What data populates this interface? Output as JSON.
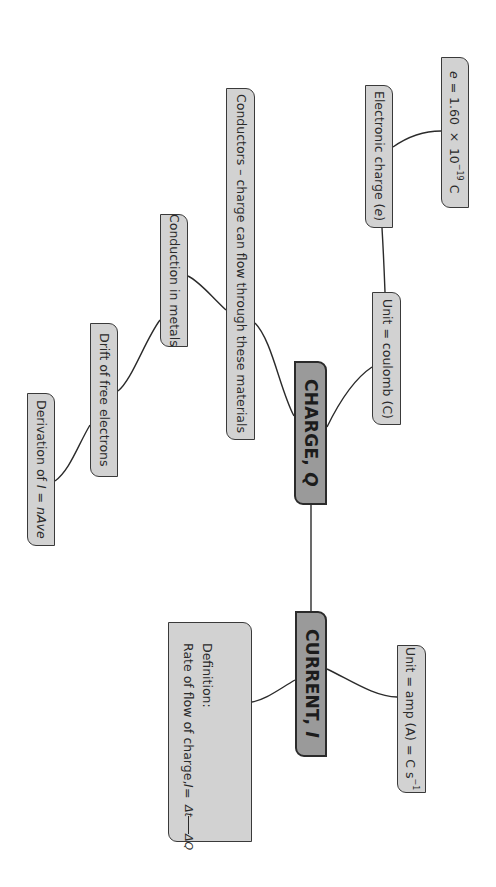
{
  "diagram": {
    "orientation": "rotated-90-clockwise",
    "colors": {
      "node_fill": "#d2d2d2",
      "main_node_fill": "#9a9a9a",
      "border": "#3a3a3a",
      "line": "#2b2b2b",
      "background": "#ffffff"
    },
    "main_nodes": {
      "charge": {
        "label": "CHARGE, ",
        "symbol": "Q"
      },
      "current": {
        "label": "CURRENT, ",
        "symbol": "I"
      }
    },
    "charge_branches": {
      "unit_coulomb": {
        "label": "Unit = coulomb (C)"
      },
      "electronic_charge": {
        "label": "Electronic charge (",
        "symbol": "e",
        "suffix": ")"
      },
      "e_value": {
        "symbol": "e",
        "label": " = 1.60 × 10",
        "exponent": "−19",
        "suffix": " C"
      },
      "conductors": {
        "label": "Conductors – charge can flow through these materials"
      },
      "conduction_metals": {
        "label": "Conduction in metals"
      },
      "drift_electrons": {
        "label": "Drift of free electrons"
      },
      "derivation": {
        "label": "Derivation of ",
        "formula_lhs": "I",
        "eq": " = ",
        "formula_rhs": "nAve"
      }
    },
    "current_branches": {
      "unit_amp": {
        "label": "Unit = amp (A) = C s",
        "exponent": "−1"
      },
      "definition": {
        "title": "Definition:",
        "text": "Rate of flow of charge, ",
        "symbol": "I",
        "eq": " = ",
        "numerator": "ΔQ",
        "denominator": "Δt"
      }
    },
    "edges": [
      [
        "charge",
        "current"
      ],
      [
        "charge",
        "unit_coulomb"
      ],
      [
        "unit_coulomb",
        "electronic_charge"
      ],
      [
        "electronic_charge",
        "e_value"
      ],
      [
        "charge",
        "conductors"
      ],
      [
        "conductors",
        "conduction_metals"
      ],
      [
        "conduction_metals",
        "drift_electrons"
      ],
      [
        "drift_electrons",
        "derivation"
      ],
      [
        "current",
        "unit_amp"
      ],
      [
        "current",
        "definition"
      ]
    ]
  }
}
